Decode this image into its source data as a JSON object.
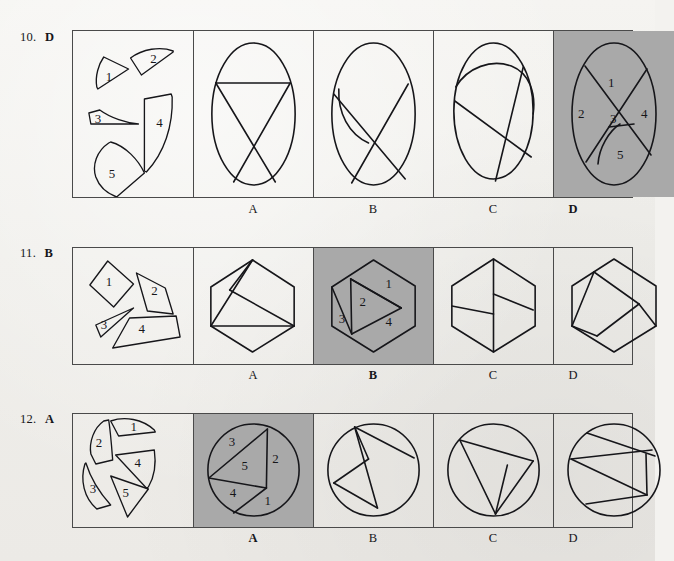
{
  "page": {
    "background_color": "#f1efec",
    "ink_color": "#16161a",
    "shaded_panel_color": "#a9a9a9",
    "width": 655,
    "height": 561
  },
  "questions": [
    {
      "id": "q10",
      "number": "10.",
      "answer": "D",
      "stimulus_pieces": [
        "1",
        "2",
        "3",
        "4",
        "5"
      ],
      "shape_family": "ellipse",
      "options": [
        {
          "letter": "A",
          "selected": false
        },
        {
          "letter": "B",
          "selected": false
        },
        {
          "letter": "C",
          "selected": false
        },
        {
          "letter": "D",
          "selected": true,
          "piece_labels": [
            "1",
            "2",
            "3",
            "4",
            "5"
          ]
        }
      ]
    },
    {
      "id": "q11",
      "number": "11.",
      "answer": "B",
      "stimulus_pieces": [
        "1",
        "2",
        "3",
        "4"
      ],
      "shape_family": "hexagon",
      "options": [
        {
          "letter": "A",
          "selected": false
        },
        {
          "letter": "B",
          "selected": true,
          "piece_labels": [
            "1",
            "2",
            "3",
            "4"
          ]
        },
        {
          "letter": "C",
          "selected": false
        },
        {
          "letter": "D",
          "selected": false
        }
      ]
    },
    {
      "id": "q12",
      "number": "12.",
      "answer": "A",
      "stimulus_pieces": [
        "1",
        "2",
        "3",
        "4",
        "5"
      ],
      "shape_family": "circle",
      "options": [
        {
          "letter": "A",
          "selected": true,
          "piece_labels": [
            "1",
            "2",
            "3",
            "4",
            "5"
          ]
        },
        {
          "letter": "B",
          "selected": false
        },
        {
          "letter": "C",
          "selected": false
        },
        {
          "letter": "D",
          "selected": false
        }
      ]
    }
  ]
}
